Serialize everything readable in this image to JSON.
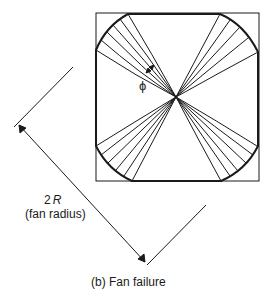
{
  "figure": {
    "caption": "(b) Fan failure",
    "angle_label": "ϕ",
    "dimension": {
      "value_label_prefix": "2",
      "value_label_symbol": "R",
      "description": "(fan radius)"
    }
  },
  "colors": {
    "stroke": "#1a1a1a",
    "background": "#ffffff"
  },
  "geometry": {
    "center": [
      176,
      97
    ],
    "square": {
      "x": 96,
      "y": 13,
      "w": 163,
      "h": 168
    },
    "fans": [
      {
        "name": "top-left",
        "ends": [
          [
            96,
            50
          ],
          [
            101,
            40
          ],
          [
            107,
            32
          ],
          [
            113,
            25
          ],
          [
            120,
            19
          ],
          [
            128,
            14
          ]
        ]
      },
      {
        "name": "top-right",
        "ends": [
          [
            220,
            14
          ],
          [
            230,
            20
          ],
          [
            239,
            28
          ],
          [
            248,
            38
          ],
          [
            258,
            52
          ]
        ]
      },
      {
        "name": "bottom-right",
        "ends": [
          [
            257,
            146
          ],
          [
            253,
            155
          ],
          [
            246,
            163
          ],
          [
            238,
            171
          ],
          [
            230,
            176
          ],
          [
            221,
            181
          ]
        ]
      },
      {
        "name": "bottom-left",
        "ends": [
          [
            96,
            146
          ],
          [
            101,
            155
          ],
          [
            108,
            163
          ],
          [
            116,
            170
          ],
          [
            124,
            176
          ],
          [
            132,
            181
          ]
        ]
      }
    ]
  }
}
